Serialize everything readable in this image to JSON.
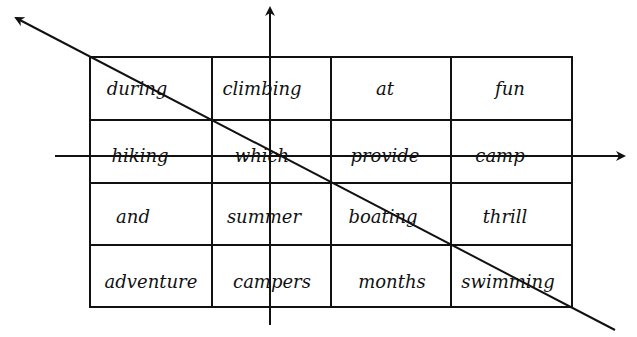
{
  "diagram": {
    "type": "word-grid-with-axes",
    "colors": {
      "ink": "#111111",
      "background": "#ffffff"
    },
    "grid": {
      "rows": 4,
      "cols": 4,
      "cells": [
        [
          "during",
          "climbing",
          "at",
          "fun"
        ],
        [
          "hiking",
          "which",
          "provide",
          "camp"
        ],
        [
          "and",
          "summer",
          "boating",
          "thrill"
        ],
        [
          "adventure",
          "campers",
          "months",
          "swimming"
        ]
      ],
      "struck_through_row": 1
    },
    "axes": {
      "horizontal": {
        "direction": "right",
        "description": "horizontal arrow crossing second row"
      },
      "vertical": {
        "direction": "up",
        "description": "vertical arrow crossing second column"
      },
      "diagonal": {
        "direction": "up-left",
        "description": "diagonal arrow through grid corners"
      }
    }
  }
}
